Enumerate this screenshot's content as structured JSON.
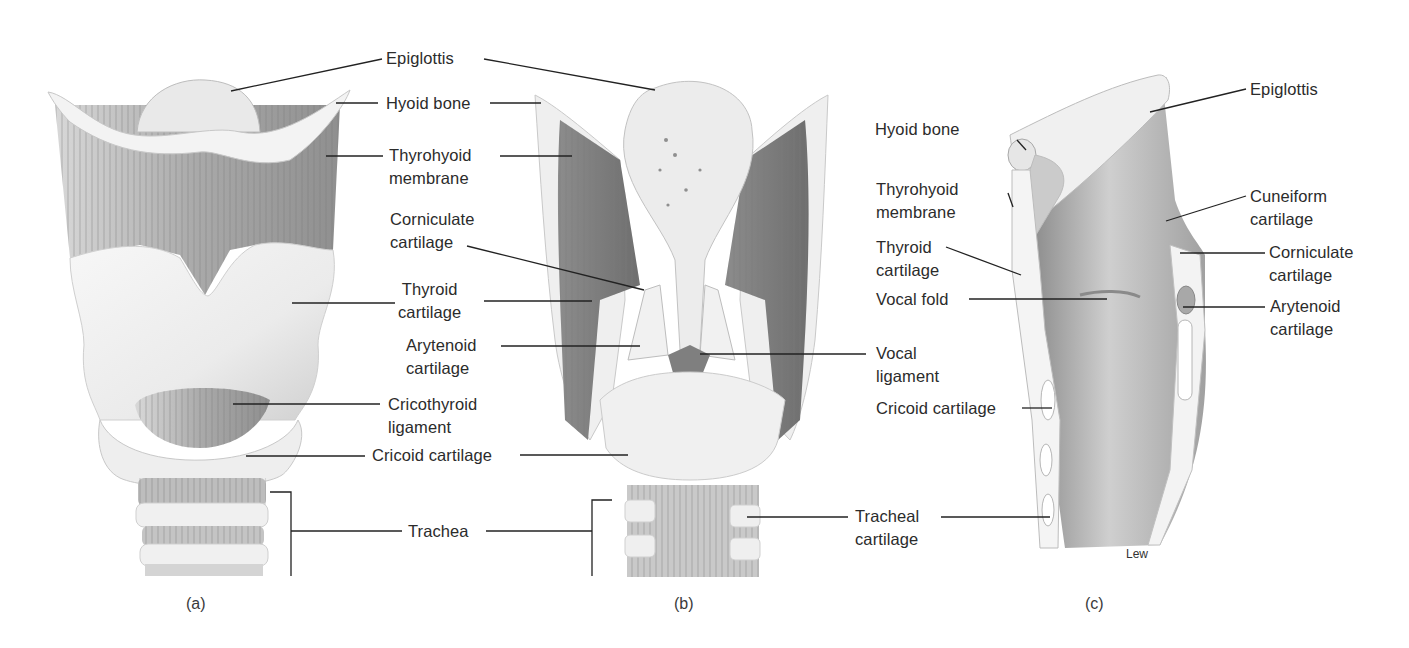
{
  "figure": {
    "artist_signature": "Lew",
    "colors": {
      "background": "#ffffff",
      "leader_line": "#222222",
      "label_text": "#2b2b2b",
      "cartilage_light": "#f2f2f2",
      "membrane_shade": "#9a9a9a",
      "lumen_dark": "#7c7c7c"
    }
  },
  "panels": [
    {
      "id": "a",
      "caption": "(a)",
      "view": "anterior",
      "labels": [
        {
          "text": "Epiglottis"
        },
        {
          "text": "Hyoid bone"
        },
        {
          "text": "Thyrohyoid\nmembrane"
        },
        {
          "text": "Thyroid\ncartilage"
        },
        {
          "text": "Cricothyroid\nligament"
        },
        {
          "text": "Cricoid cartilage"
        },
        {
          "text": "Trachea"
        }
      ]
    },
    {
      "id": "b",
      "caption": "(b)",
      "view": "posterior",
      "labels": [
        {
          "text": "Corniculate\ncartilage"
        },
        {
          "text": "Arytenoid\ncartilage"
        },
        {
          "text": "Vocal\nligament"
        },
        {
          "text": "Tracheal\ncartilage"
        }
      ]
    },
    {
      "id": "c",
      "caption": "(c)",
      "view": "sagittal section",
      "labels": [
        {
          "text": "Epiglottis"
        },
        {
          "text": "Hyoid bone"
        },
        {
          "text": "Thyrohyoid\nmembrane"
        },
        {
          "text": "Cuneiform\ncartilage"
        },
        {
          "text": "Thyroid\ncartilage"
        },
        {
          "text": "Corniculate\ncartilage"
        },
        {
          "text": "Vocal fold"
        },
        {
          "text": "Arytenoid\ncartilage"
        },
        {
          "text": "Cricoid cartilage"
        }
      ]
    }
  ],
  "shared_labels": {
    "epiglottis": "Epiglottis",
    "hyoid_bone": "Hyoid bone",
    "thyrohyoid_membrane": "Thyrohyoid\nmembrane",
    "corniculate_cartilage": "Corniculate\ncartilage",
    "thyroid_cartilage": "Thyroid\ncartilage",
    "arytenoid_cartilage": "Arytenoid\ncartilage",
    "cricothyroid_ligament": "Cricothyroid\nligament",
    "cricoid_cartilage": "Cricoid cartilage",
    "trachea": "Trachea",
    "vocal_ligament": "Vocal\nligament",
    "tracheal_cartilage": "Tracheal\ncartilage",
    "c_epiglottis": "Epiglottis",
    "c_hyoid_bone": "Hyoid bone",
    "c_thyrohyoid_membrane": "Thyrohyoid\nmembrane",
    "c_thyroid_cartilage": "Thyroid\ncartilage",
    "c_vocal_fold": "Vocal fold",
    "c_cricoid_cartilage": "Cricoid cartilage",
    "c_cuneiform_cartilage": "Cuneiform\ncartilage",
    "c_corniculate_cartilage": "Corniculate\ncartilage",
    "c_arytenoid_cartilage": "Arytenoid\ncartilage"
  },
  "captions": {
    "a": "(a)",
    "b": "(b)",
    "c": "(c)"
  }
}
